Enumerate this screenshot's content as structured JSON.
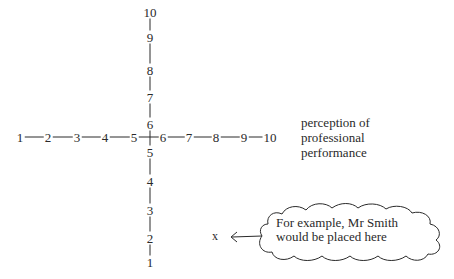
{
  "diagram": {
    "horizontal_axis": {
      "ticks": [
        "1",
        "2",
        "3",
        "4",
        "5",
        "6",
        "7",
        "8",
        "9",
        "10"
      ],
      "label_lines": [
        "perception of",
        "professional",
        "performance"
      ]
    },
    "vertical_axis": {
      "ticks": [
        "1",
        "2",
        "3",
        "4",
        "5",
        "6",
        "7",
        "8",
        "9",
        "10"
      ]
    },
    "marker": {
      "symbol": "x"
    },
    "callout": {
      "lines": [
        "For example, Mr Smith",
        "would be placed here"
      ]
    },
    "colors": {
      "ink": "#2a2a2a",
      "background": "#ffffff"
    }
  }
}
